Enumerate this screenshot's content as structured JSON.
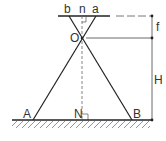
{
  "diagram": {
    "labels": {
      "b": "b",
      "n": "n",
      "a": "a",
      "O": "O",
      "A": "A",
      "N": "N",
      "B": "B",
      "f": "f",
      "H": "H"
    },
    "colors": {
      "line": "#222222",
      "dimension": "#444444",
      "text": "#333333",
      "hatch": "#666666"
    }
  }
}
